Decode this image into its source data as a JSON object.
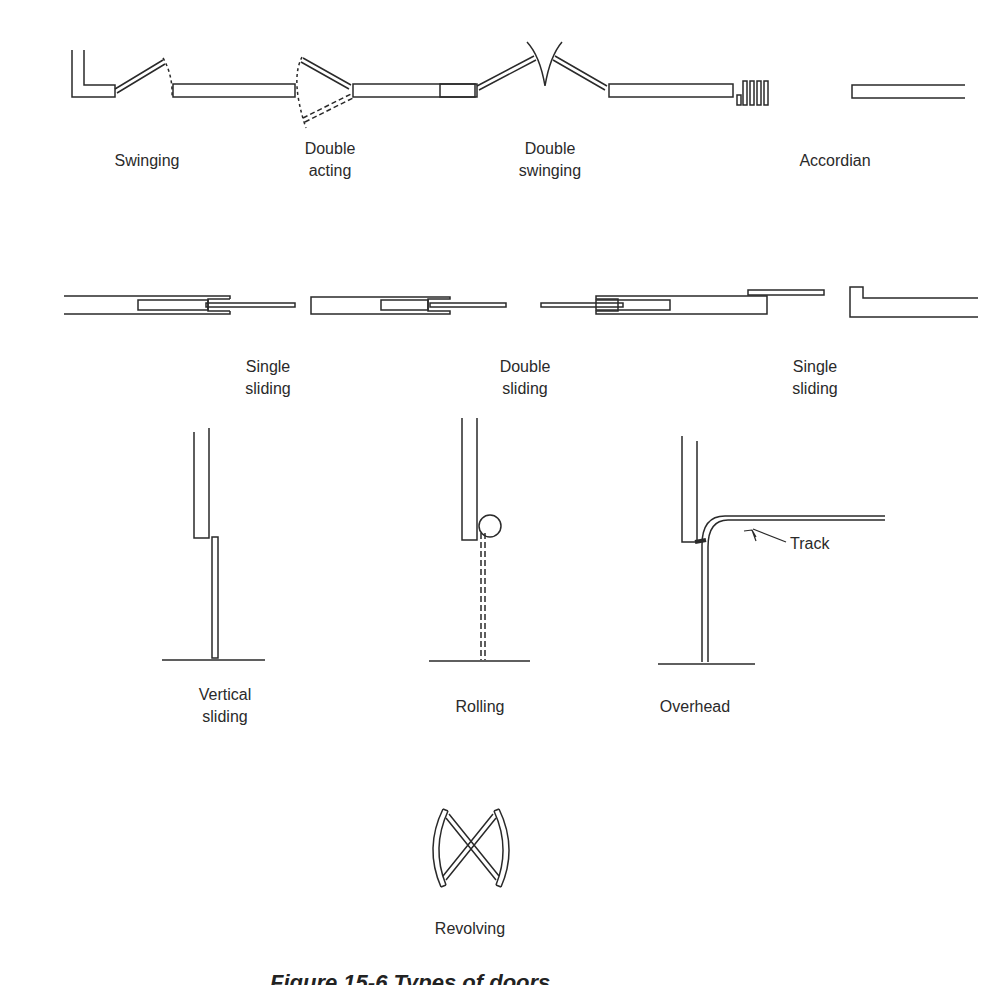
{
  "figure": {
    "stroke_color": "#2a2a2a",
    "background": "#ffffff"
  },
  "labels": {
    "swinging": [
      "Swinging"
    ],
    "double_acting": [
      "Double",
      "acting"
    ],
    "double_swinging": [
      "Double",
      "swinging"
    ],
    "accordian": [
      "Accordian"
    ],
    "single_sliding_left": [
      "Single",
      "sliding"
    ],
    "double_sliding": [
      "Double",
      "sliding"
    ],
    "single_sliding_right": [
      "Single",
      "sliding"
    ],
    "vertical_sliding": [
      "Vertical",
      "sliding"
    ],
    "rolling": [
      "Rolling"
    ],
    "overhead": [
      "Overhead"
    ],
    "track": "Track",
    "revolving": [
      "Revolving"
    ]
  },
  "caption": "Figure 15-6  Types of doors"
}
